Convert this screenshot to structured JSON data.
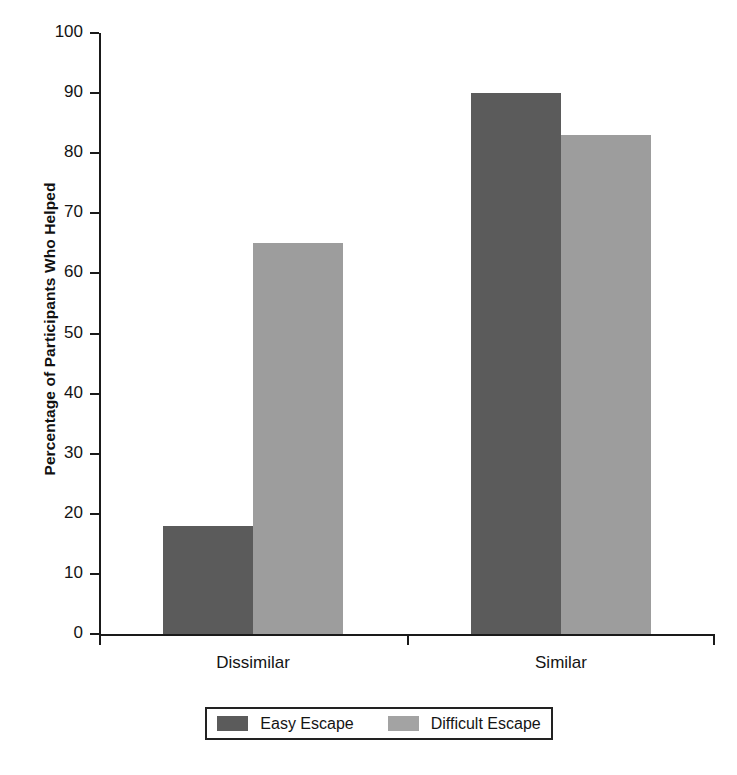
{
  "chart_data": {
    "type": "bar",
    "title": "",
    "xlabel": "",
    "ylabel": "Percentage of Participants Who Helped",
    "categories": [
      "Dissimilar",
      "Similar"
    ],
    "series": [
      {
        "name": "Easy Escape",
        "values": [
          18,
          90
        ],
        "color": "#5b5b5b"
      },
      {
        "name": "Difficult Escape",
        "values": [
          65,
          83
        ],
        "color": "#9d9d9d"
      }
    ],
    "ylim": [
      0,
      100
    ],
    "ytick_labels": [
      "0",
      "10",
      "20",
      "30",
      "40",
      "50",
      "60",
      "70",
      "80",
      "90",
      "100"
    ],
    "ytick_values": [
      0,
      10,
      20,
      30,
      40,
      50,
      60,
      70,
      80,
      90,
      100
    ],
    "grid": false,
    "legend_position": "bottom"
  },
  "legend": {
    "items": [
      {
        "label": "Easy Escape",
        "swatch": "legend-swatch-easy-escape"
      },
      {
        "label": "Difficult Escape",
        "swatch": "legend-swatch-difficult-escape"
      }
    ]
  }
}
